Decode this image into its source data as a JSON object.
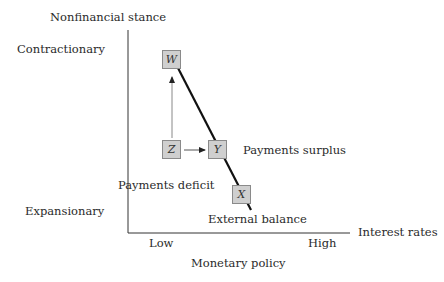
{
  "diagram": {
    "y_axis": {
      "title": "Nonfinancial stance",
      "top_label": "Contractionary",
      "bottom_label": "Expansionary"
    },
    "x_axis": {
      "title": "Monetary policy",
      "end_label": "Interest rates",
      "left_label": "Low",
      "right_label": "High"
    },
    "points": {
      "W": "W",
      "Z": "Z",
      "Y": "Y",
      "X": "X"
    },
    "regions": {
      "surplus": "Payments surplus",
      "deficit": "Payments deficit"
    },
    "curve_label": "External balance",
    "colors": {
      "box_fill": "#cfcfcf",
      "box_border": "#8a8a8a",
      "curve": "#111111",
      "arrow": "#888888",
      "axis": "#333333"
    }
  }
}
